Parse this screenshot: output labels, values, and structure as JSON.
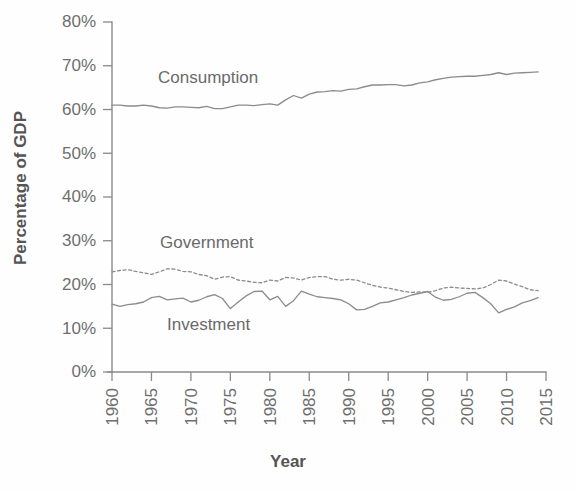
{
  "chart_data": {
    "type": "line",
    "title": "",
    "xlabel": "Year",
    "ylabel": "Percentage of GDP",
    "xlim": [
      1960,
      2015
    ],
    "ylim": [
      0,
      80
    ],
    "grid": false,
    "legend_position": "inline-annotations",
    "x_ticks": [
      "1960",
      "1965",
      "1970",
      "1975",
      "1980",
      "1985",
      "1990",
      "1995",
      "2000",
      "2005",
      "2010",
      "2015"
    ],
    "y_ticks": [
      "0%",
      "10%",
      "20%",
      "30%",
      "40%",
      "50%",
      "60%",
      "70%",
      "80%"
    ],
    "x": [
      1960,
      1961,
      1962,
      1963,
      1964,
      1965,
      1966,
      1967,
      1968,
      1969,
      1970,
      1971,
      1972,
      1973,
      1974,
      1975,
      1976,
      1977,
      1978,
      1979,
      1980,
      1981,
      1982,
      1983,
      1984,
      1985,
      1986,
      1987,
      1988,
      1989,
      1990,
      1991,
      1992,
      1993,
      1994,
      1995,
      1996,
      1997,
      1998,
      1999,
      2000,
      2001,
      2002,
      2003,
      2004,
      2005,
      2006,
      2007,
      2008,
      2009,
      2010,
      2011,
      2012,
      2013,
      2014
    ],
    "series": [
      {
        "name": "Consumption",
        "style": "solid",
        "color": "#8c8c8c",
        "values": [
          61.0,
          61.0,
          60.8,
          60.8,
          61.0,
          60.8,
          60.4,
          60.3,
          60.6,
          60.6,
          60.5,
          60.4,
          60.7,
          60.2,
          60.2,
          60.6,
          61.0,
          61.0,
          60.9,
          61.1,
          61.3,
          61.0,
          62.2,
          63.2,
          62.6,
          63.5,
          64.0,
          64.1,
          64.3,
          64.2,
          64.6,
          64.7,
          65.2,
          65.6,
          65.6,
          65.7,
          65.7,
          65.4,
          65.6,
          66.1,
          66.3,
          66.8,
          67.1,
          67.4,
          67.5,
          67.6,
          67.6,
          67.8,
          68.0,
          68.4,
          68.0,
          68.3,
          68.4,
          68.5,
          68.6
        ]
      },
      {
        "name": "Government",
        "style": "dotted",
        "color": "#8c8c8c",
        "values": [
          22.9,
          23.2,
          23.4,
          23.0,
          22.7,
          22.3,
          22.9,
          23.6,
          23.5,
          23.0,
          22.9,
          22.3,
          22.0,
          21.2,
          21.7,
          21.8,
          21.0,
          20.8,
          20.5,
          20.4,
          21.0,
          20.8,
          21.6,
          21.5,
          21.0,
          21.6,
          21.8,
          21.8,
          21.2,
          21.0,
          21.2,
          21.0,
          20.4,
          19.8,
          19.4,
          19.2,
          18.8,
          18.4,
          18.2,
          18.3,
          18.2,
          18.6,
          19.2,
          19.4,
          19.2,
          19.1,
          19.0,
          19.2,
          20.0,
          21.0,
          20.8,
          20.1,
          19.5,
          18.8,
          18.6
        ]
      },
      {
        "name": "Investment",
        "style": "solid",
        "color": "#8c8c8c",
        "values": [
          15.5,
          15.0,
          15.4,
          15.6,
          16.0,
          17.0,
          17.3,
          16.5,
          16.7,
          16.9,
          16.0,
          16.4,
          17.2,
          17.7,
          16.8,
          14.5,
          16.0,
          17.4,
          18.4,
          18.5,
          16.5,
          17.3,
          15.0,
          16.3,
          18.5,
          17.8,
          17.2,
          17.0,
          16.8,
          16.5,
          15.6,
          14.2,
          14.3,
          15.0,
          15.8,
          16.0,
          16.5,
          17.0,
          17.6,
          18.0,
          18.4,
          17.1,
          16.4,
          16.6,
          17.2,
          18.0,
          18.2,
          17.0,
          15.6,
          13.5,
          14.3,
          14.9,
          15.8,
          16.3,
          17.0
        ]
      }
    ],
    "annotations": [
      {
        "label": "Consumption",
        "x_px": 158,
        "y_px": 83
      },
      {
        "label": "Government",
        "x_px": 160,
        "y_px": 248
      },
      {
        "label": "Investment",
        "x_px": 167,
        "y_px": 330
      }
    ]
  }
}
